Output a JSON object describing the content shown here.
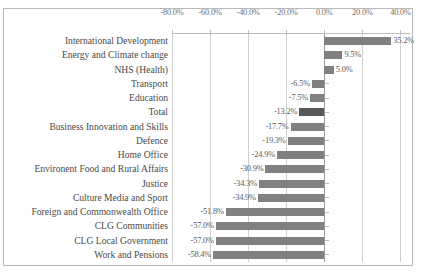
{
  "chart_data": {
    "type": "bar",
    "orientation": "horizontal",
    "title": "",
    "subtitle": "",
    "xlabel": "",
    "ylabel": "",
    "xlim": [
      -80,
      45
    ],
    "grid": true,
    "legend": false,
    "legend_position": "none",
    "axis_position": "top",
    "value_format": "percent_one_decimal",
    "xticks": [
      -80,
      -60,
      -40,
      -20,
      0,
      20,
      40
    ],
    "xtick_labels": [
      "-80.0%",
      "-60.0%",
      "-40.0%",
      "-20.0%",
      "0.0%",
      "20.0%",
      "40.0%"
    ],
    "categories": [
      "International Development",
      "Energy and Climate change",
      "NHS (Health)",
      "Transport",
      "Education",
      "Total",
      "Business Innovation and Skills",
      "Defence",
      "Home Office",
      "Environent Food and Rural Affairs",
      "Justice",
      "Culture Media and Sport",
      "Foreign and Commonwealth Office",
      "CLG Communities",
      "CLG Local Government",
      "Work and Pensions"
    ],
    "values": [
      35.2,
      9.5,
      5.0,
      -6.5,
      -7.5,
      -13.2,
      -17.7,
      -19.3,
      -24.9,
      -30.9,
      -34.3,
      -34.9,
      -51.8,
      -57.0,
      -57.0,
      -58.4
    ],
    "value_labels": [
      "35.2%",
      "9.5%",
      "5.0%",
      "-6.5%",
      "-7.5%",
      "-13.2%",
      "-17.7%",
      "-19.3%",
      "-24.9%",
      "-30.9%",
      "-34.3%",
      "-34.9%",
      "-51.8%",
      "-57.0%",
      "-57.0%",
      "-58.4%"
    ],
    "highlight_category": "Total",
    "colors": {
      "bar": "#808080",
      "bar_highlight": "#595959",
      "gridline": "#cfcfcf",
      "axis": "#9a9a9a",
      "frame": "#b9b9b9",
      "label_text": "#4a4a4a",
      "tick_text": "#6f6f6f",
      "value_text": "#5a5a5a",
      "background": "#ffffff"
    }
  }
}
